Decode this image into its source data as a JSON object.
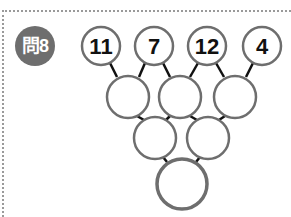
{
  "question": {
    "label": "問8",
    "top_row": [
      "11",
      "7",
      "12",
      "4"
    ],
    "rows": [
      [
        "11",
        "7",
        "12",
        "4"
      ],
      [
        "",
        "",
        ""
      ],
      [
        "",
        ""
      ],
      [
        ""
      ]
    ]
  }
}
